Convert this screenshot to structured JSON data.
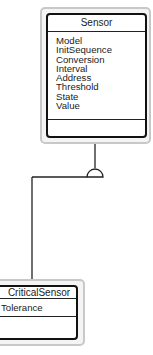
{
  "diagram": {
    "type": "UML class diagram (generalization)",
    "classes": [
      {
        "id": "sensor",
        "name": "Sensor",
        "attributes": [
          "Model",
          "InitSequence",
          "Conversion",
          "Interval",
          "Address",
          "Threshold",
          "State",
          "Value"
        ],
        "operations": []
      },
      {
        "id": "critical-sensor",
        "name": "CriticalSensor",
        "attributes": [
          "Tolerance"
        ],
        "operations": []
      }
    ],
    "relationships": [
      {
        "type": "generalization",
        "from": "CriticalSensor",
        "to": "Sensor",
        "marker": "semicircle"
      }
    ]
  },
  "colors": {
    "box_border": "#111111",
    "shadow_border": "#c8c8c8",
    "line": "#222222"
  }
}
